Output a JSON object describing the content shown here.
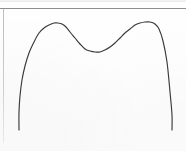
{
  "figure": {
    "title": "",
    "background_color": "#fefefe",
    "curve_color": "#3a3a3a",
    "frame_color": "#8e8e8e",
    "frame_left_color": "#cfcfcf"
  },
  "chart_data": {
    "type": "line",
    "title": "",
    "subtitle": "",
    "xlabel": "",
    "ylabel": "",
    "xlim": [
      0,
      186
    ],
    "ylim": [
      0,
      151
    ],
    "grid": false,
    "legend": null,
    "annotations": [],
    "axis_tick_labels": {
      "x": [],
      "y": []
    },
    "series": [
      {
        "name": "bimodal-density-curve",
        "color": "#3a3a3a",
        "x": [
          19,
          19,
          20,
          22,
          25,
          29,
          34,
          39,
          44,
          49,
          54,
          58,
          62,
          66,
          70,
          75,
          80,
          85,
          90,
          95,
          100,
          105,
          110,
          115,
          120,
          125,
          130,
          135,
          140,
          145,
          150,
          155,
          159,
          163,
          167,
          170,
          172,
          172
        ],
        "y": [
          130,
          112,
          96,
          80,
          66,
          53,
          42,
          33,
          28,
          25,
          23,
          23,
          24,
          27,
          32,
          38,
          44,
          49,
          51,
          52,
          52,
          50,
          47,
          43,
          38,
          33,
          29,
          25,
          23,
          22,
          22,
          24,
          29,
          41,
          62,
          92,
          115,
          130
        ]
      }
    ],
    "features": {
      "left_peak": {
        "x": 56,
        "y": 23
      },
      "right_peak": {
        "x": 146,
        "y": 22
      },
      "central_valley": {
        "x": 98,
        "y": 52
      },
      "left_tail_end": {
        "x": 19,
        "y": 130
      },
      "right_tail_end": {
        "x": 172,
        "y": 130
      },
      "shape": "bimodal twin-peaked density with shallow central dip"
    }
  }
}
